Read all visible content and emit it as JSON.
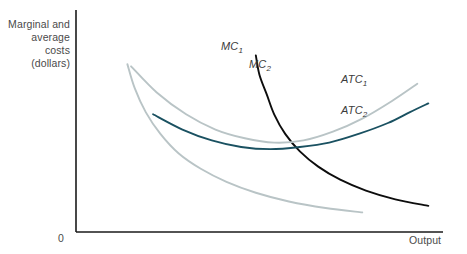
{
  "axes": {
    "y_title": "Marginal and\naverage costs\n(dollars)",
    "x_title": "Output",
    "origin_label": "0",
    "axis_color": "#1a1a1a"
  },
  "labels": {
    "mc1": "MC",
    "mc1_sub": "1",
    "mc2": "MC",
    "mc2_sub": "2",
    "atc1": "ATC",
    "atc1_sub": "1",
    "atc2": "ATC",
    "atc2_sub": "2"
  },
  "chart_data": {
    "type": "line",
    "title": "",
    "xlabel": "Output",
    "ylabel": "Marginal and average costs (dollars)",
    "grid": false,
    "legend": "inline-curve-labels",
    "axis_origin_label": "0",
    "xlim": [
      0,
      100
    ],
    "ylim": [
      0,
      100
    ],
    "series": [
      {
        "name": "MC1",
        "label": "MC₁",
        "color": "#b9c4c6",
        "style": "solid",
        "description": "Marginal cost curve for plant size 1; steep rising curve at left",
        "points": [
          [
            14,
            77
          ],
          [
            16,
            66
          ],
          [
            19,
            55
          ],
          [
            23,
            45
          ],
          [
            28,
            36
          ],
          [
            34,
            29
          ],
          [
            41,
            23
          ],
          [
            49,
            18
          ],
          [
            58,
            14
          ],
          [
            68,
            11
          ],
          [
            78,
            9
          ]
        ]
      },
      {
        "name": "MC2",
        "label": "MC₂",
        "color": "#0d0d0d",
        "style": "solid",
        "description": "Marginal cost curve for plant size 2; steep rising curve shifted right of MC1",
        "points": [
          [
            49,
            81
          ],
          [
            50,
            72
          ],
          [
            52,
            63
          ],
          [
            54,
            54
          ],
          [
            57,
            45
          ],
          [
            61,
            37
          ],
          [
            66,
            30
          ],
          [
            72,
            24
          ],
          [
            79,
            19
          ],
          [
            87,
            15
          ],
          [
            96,
            12
          ]
        ]
      },
      {
        "name": "ATC1",
        "label": "ATC₁",
        "color": "#b9c4c6",
        "style": "solid",
        "description": "U-shaped average total cost curve for plant size 1; minimum near mid-range output",
        "points": [
          [
            15,
            76
          ],
          [
            22,
            64
          ],
          [
            30,
            54
          ],
          [
            38,
            47
          ],
          [
            46,
            43
          ],
          [
            54,
            41
          ],
          [
            62,
            42
          ],
          [
            70,
            46
          ],
          [
            78,
            52
          ],
          [
            86,
            60
          ],
          [
            93,
            68
          ]
        ]
      },
      {
        "name": "ATC2",
        "label": "ATC₂",
        "color": "#1a5161",
        "style": "solid",
        "description": "Flatter U-shaped average total cost curve for plant size 2; lower and broader minimum",
        "points": [
          [
            21,
            54
          ],
          [
            29,
            47
          ],
          [
            37,
            42
          ],
          [
            45,
            39
          ],
          [
            53,
            38
          ],
          [
            61,
            39
          ],
          [
            69,
            41
          ],
          [
            77,
            45
          ],
          [
            85,
            50
          ],
          [
            91,
            55
          ],
          [
            96,
            59
          ]
        ]
      }
    ]
  }
}
